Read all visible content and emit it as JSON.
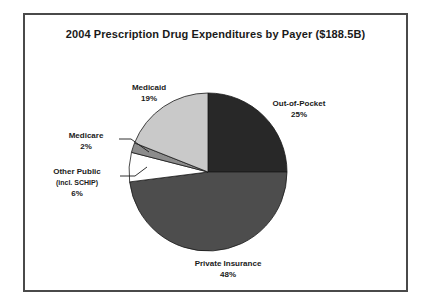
{
  "figure": {
    "title": "2004 Prescription Drug Expenditures by Payer ($188.5B)",
    "frame_color": "#4a4a4a",
    "background": "#ffffff"
  },
  "labels": {
    "medicaid_name": "Medicaid",
    "medicaid_pct": "19%",
    "out_of_pocket_name": "Out-of-Pocket",
    "out_of_pocket_pct": "25%",
    "medicare_name": "Medicare",
    "medicare_pct": "2%",
    "other_public_name": "Other Public",
    "other_public_sub": "(incl. SCHIP)",
    "other_public_pct": "6%",
    "private_insurance_name": "Private Insurance",
    "private_insurance_pct": "48%"
  },
  "chart_data": {
    "type": "pie",
    "title": "2004 Prescription Drug Expenditures by Payer ($188.5B)",
    "total_label": "$188.5B",
    "total_value": 188.5,
    "units": "percent of total expenditures",
    "categories": [
      "Out-of-Pocket",
      "Private Insurance",
      "Other Public (incl. SCHIP)",
      "Medicare",
      "Medicaid"
    ],
    "values": [
      25,
      48,
      6,
      2,
      19
    ],
    "slices": [
      {
        "label": "Out-of-Pocket",
        "value": 25,
        "display": "25%",
        "color": "#282828",
        "start_angle_deg": 0,
        "end_angle_deg": 90,
        "leader_line": false
      },
      {
        "label": "Private Insurance",
        "value": 48,
        "display": "48%",
        "color": "#4d4d4d",
        "start_angle_deg": 90,
        "end_angle_deg": 262.8,
        "leader_line": false
      },
      {
        "label": "Other Public (incl. SCHIP)",
        "value": 6,
        "display": "6%",
        "color": "#ffffff",
        "start_angle_deg": 262.8,
        "end_angle_deg": 284.4,
        "leader_line": true
      },
      {
        "label": "Medicare",
        "value": 2,
        "display": "2%",
        "color": "#8c8c8c",
        "start_angle_deg": 284.4,
        "end_angle_deg": 291.6,
        "leader_line": true
      },
      {
        "label": "Medicaid",
        "value": 19,
        "display": "19%",
        "color": "#c9c9c9",
        "start_angle_deg": 291.6,
        "end_angle_deg": 360,
        "leader_line": false
      }
    ],
    "legend": "none",
    "grid": false,
    "slice_border_color": "#1a1a1a"
  }
}
